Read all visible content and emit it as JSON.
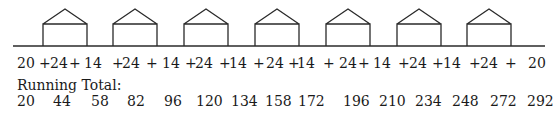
{
  "diagram": {
    "houses": [
      {
        "x": 43
      },
      {
        "x": 113
      },
      {
        "x": 184
      },
      {
        "x": 255
      },
      {
        "x": 326
      },
      {
        "x": 397
      },
      {
        "x": 467
      }
    ],
    "house_width": 44,
    "ground_y": 46,
    "wall_top_y": 24,
    "roof_peak_y": 9,
    "ground_x1": 13,
    "ground_x2": 545,
    "stroke_color": "#2a2a2a"
  },
  "sum_row": [
    {
      "text": "20",
      "x": 17
    },
    {
      "text": "+",
      "x": 39
    },
    {
      "text": "24",
      "x": 50
    },
    {
      "text": "+",
      "x": 69
    },
    {
      "text": "14",
      "x": 84
    },
    {
      "text": "+",
      "x": 112
    },
    {
      "text": "24",
      "x": 122
    },
    {
      "text": "+",
      "x": 146
    },
    {
      "text": "14",
      "x": 162
    },
    {
      "text": "+",
      "x": 185
    },
    {
      "text": "24",
      "x": 195
    },
    {
      "text": "+",
      "x": 219
    },
    {
      "text": "14",
      "x": 229
    },
    {
      "text": "+",
      "x": 253
    },
    {
      "text": "24",
      "x": 266
    },
    {
      "text": "+",
      "x": 288
    },
    {
      "text": "14",
      "x": 297
    },
    {
      "text": "+",
      "x": 323
    },
    {
      "text": "24",
      "x": 339
    },
    {
      "text": "+",
      "x": 358
    },
    {
      "text": "14",
      "x": 373
    },
    {
      "text": "+",
      "x": 398
    },
    {
      "text": "24",
      "x": 409
    },
    {
      "text": "+",
      "x": 432
    },
    {
      "text": "14",
      "x": 443
    },
    {
      "text": "+",
      "x": 469
    },
    {
      "text": "24",
      "x": 480
    },
    {
      "text": "+",
      "x": 505
    },
    {
      "text": "20",
      "x": 528
    }
  ],
  "running_total": {
    "label": "Running Total:",
    "values": [
      {
        "text": "20",
        "x": 17
      },
      {
        "text": "44",
        "x": 53
      },
      {
        "text": "58",
        "x": 91
      },
      {
        "text": "82",
        "x": 127
      },
      {
        "text": "96",
        "x": 164
      },
      {
        "text": "120",
        "x": 196
      },
      {
        "text": "134",
        "x": 231
      },
      {
        "text": "158",
        "x": 265
      },
      {
        "text": "172",
        "x": 298
      },
      {
        "text": "196",
        "x": 343
      },
      {
        "text": "210",
        "x": 379
      },
      {
        "text": "234",
        "x": 415
      },
      {
        "text": "248",
        "x": 452
      },
      {
        "text": "272",
        "x": 490
      },
      {
        "text": "292",
        "x": 527
      }
    ]
  }
}
